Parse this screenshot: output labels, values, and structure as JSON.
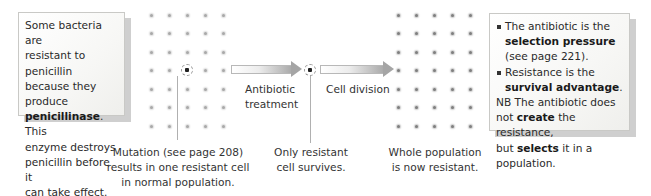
{
  "left_box": {
    "line1": "Some bacteria are",
    "line2": "resistant to penicillin",
    "line3": "because they produce",
    "line4_bold": "penicillinase",
    "line4_rest": ". This",
    "line5": "enzyme destroys",
    "line6": "penicillin before it",
    "line7": "can take effect."
  },
  "right_box": {
    "bullet1_a": "The antibiotic is the",
    "bullet1_bold": "selection pressure",
    "bullet1_c": "(see page 221).",
    "bullet2_a": "Resistance is the",
    "bullet2_bold": "survival advantage",
    "bullet2_end": ".",
    "nb_line1": "NB The antibiotic does",
    "nb_line2_a": "not ",
    "nb_line2_bold": "create",
    "nb_line2_c": " the resistance,",
    "nb_line3_a": "but ",
    "nb_line3_bold": "selects",
    "nb_line3_c": " it in a population."
  },
  "arrows": {
    "arrow1_line1": "Antibiotic",
    "arrow1_line2": "treatment",
    "arrow2_label": "Cell division"
  },
  "captions": {
    "stage1_line1": "Mutation (see page 208)",
    "stage1_line2": "results in one resistant cell",
    "stage1_line3": "in normal population.",
    "stage2_line1": "Only resistant",
    "stage2_line2": "cell survives.",
    "stage3_line1": "Whole population",
    "stage3_line2": "is now resistant."
  },
  "grids": {
    "rows": 7,
    "cols": 5,
    "resistant_cell_position": {
      "row": 4,
      "col": 3
    }
  },
  "colors": {
    "box_border": "#c9c9c6",
    "box_shadow": "#cfcfcf",
    "arrow_fill": "#a9a9a9",
    "dot_faint": "#a9a9a9",
    "dot_dark": "#7f7f7f"
  }
}
